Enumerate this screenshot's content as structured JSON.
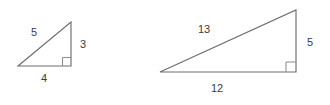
{
  "figure": {
    "background_color": "#ffffff",
    "stroke_color": "#6e6e72",
    "label_color": "#3b3b3f",
    "right_angle_marker_color": "#8a8a8e"
  },
  "triangles": [
    {
      "name": "small-triangle",
      "description": "3-4-5 right triangle, right angle at bottom-right",
      "vertices": {
        "left": [
          18,
          66
        ],
        "bottom_right": [
          71,
          66
        ],
        "apex": [
          71,
          22
        ]
      },
      "right_angle_at": "bottom-right",
      "labels": {
        "hypotenuse": "5",
        "vertical_leg": "3",
        "horizontal_leg": "4"
      },
      "label_positions": {
        "hypotenuse": [
          34,
          32
        ],
        "vertical_leg": [
          83,
          44
        ],
        "horizontal_leg": [
          44,
          78
        ]
      }
    },
    {
      "name": "large-triangle",
      "description": "5-12-13 right triangle, right angle at bottom-right",
      "vertices": {
        "left": [
          160,
          72
        ],
        "bottom_right": [
          296,
          72
        ],
        "apex": [
          296,
          10
        ]
      },
      "right_angle_at": "bottom-right",
      "labels": {
        "hypotenuse": "13",
        "vertical_leg": "5",
        "horizontal_leg": "12"
      },
      "label_positions": {
        "hypotenuse": [
          204,
          29
        ],
        "vertical_leg": [
          310,
          42
        ],
        "horizontal_leg": [
          217,
          88
        ]
      }
    }
  ]
}
